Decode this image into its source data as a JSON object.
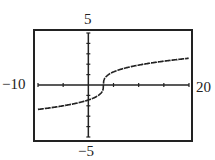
{
  "chart_data": {
    "type": "line",
    "title": "",
    "function": "y = cbrt(x - 3)",
    "xlim": [
      -10,
      20
    ],
    "ylim": [
      -5,
      5
    ],
    "xlabel": "",
    "ylabel": "",
    "grid": false,
    "x_tick_step": 5,
    "y_tick_step": 1,
    "window_labels": {
      "xmin": "−10",
      "xmax": "20",
      "ymax": "5",
      "ymin": "−5"
    },
    "x": [
      -10,
      -5,
      0,
      2,
      2.9,
      3,
      3.1,
      4,
      5,
      10,
      15,
      20
    ],
    "series": [
      {
        "name": "f(x)",
        "values": [
          -2.351,
          -2.0,
          -1.442,
          -1.0,
          -0.464,
          0.0,
          0.464,
          1.0,
          1.26,
          1.913,
          2.289,
          2.571
        ]
      }
    ]
  },
  "labels": {
    "xmin": "−10",
    "xmax": "20",
    "ymax": "5",
    "ymin": "−5"
  },
  "colors": {
    "ink": "#222222",
    "background": "#ffffff"
  }
}
